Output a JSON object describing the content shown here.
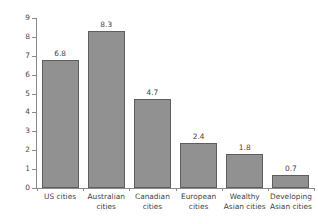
{
  "chart_data": {
    "type": "bar",
    "title": "",
    "xlabel": "",
    "ylabel": "Metres of road per person",
    "ylim": [
      0,
      9
    ],
    "ytick_labels": [
      "0",
      "1",
      "2",
      "3",
      "4",
      "5",
      "6",
      "7",
      "8",
      "9"
    ],
    "grid": false,
    "legend": false,
    "categories": [
      "US cities",
      "Australian cities",
      "Canadian cities",
      "European cities",
      "Wealthy Asian cities",
      "Developing Asian cities"
    ],
    "category_lines": [
      [
        "US cities"
      ],
      [
        "Australian",
        "cities"
      ],
      [
        "Canadian",
        "cities"
      ],
      [
        "European",
        "cities"
      ],
      [
        "Wealthy",
        "Asian cities"
      ],
      [
        "Developing",
        "Asian cities"
      ]
    ],
    "values": [
      6.8,
      8.3,
      4.7,
      2.4,
      1.8,
      0.7
    ],
    "value_labels": [
      "6.8",
      "8.3",
      "4.7",
      "2.4",
      "1.8",
      "0.7"
    ],
    "colors": {
      "bar_fill": "#919191",
      "bar_edge": "#5e5e5e",
      "axis": "#8a8a8a",
      "text": "#3f3f3f",
      "background": "#ffffff"
    }
  }
}
